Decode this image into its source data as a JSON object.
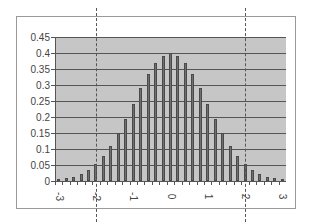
{
  "chart_data": {
    "type": "bar",
    "title": "",
    "xlabel": "",
    "ylabel": "",
    "categories": [
      "-3",
      "-2.8",
      "-2.6",
      "-2.4",
      "-2.2",
      "-2",
      "-1.8",
      "-1.6",
      "-1.4",
      "-1.2",
      "-1",
      "-0.8",
      "-0.6",
      "-0.4",
      "-0.2",
      "0",
      "0.2",
      "0.4",
      "0.6",
      "0.8",
      "1",
      "1.2",
      "1.4",
      "1.6",
      "1.8",
      "2",
      "2.2",
      "2.4",
      "2.6",
      "2.8",
      "3"
    ],
    "values": [
      0.0044,
      0.0079,
      0.0136,
      0.0224,
      0.0355,
      0.054,
      0.079,
      0.1109,
      0.1497,
      0.1942,
      0.242,
      0.2897,
      0.3332,
      0.3683,
      0.391,
      0.3989,
      0.391,
      0.3683,
      0.3332,
      0.2897,
      0.242,
      0.1942,
      0.1497,
      0.1109,
      0.079,
      0.054,
      0.0355,
      0.0224,
      0.0136,
      0.0079,
      0.0044
    ],
    "ylim": [
      0,
      0.45
    ],
    "yticks": [
      "0",
      "0.05",
      "0.1",
      "0.15",
      "0.2",
      "0.25",
      "0.3",
      "0.35",
      "0.4",
      "0.45"
    ],
    "xtick_labels": [
      "-3",
      "-2",
      "-1",
      "0",
      "1",
      "2",
      "3"
    ],
    "grid": true,
    "legend": null,
    "annotations": [
      {
        "type": "vertical-dashed-line",
        "x": -2
      },
      {
        "type": "vertical-dashed-line",
        "x": 2
      }
    ],
    "colors": {
      "plot_bg": "#c6c6c6",
      "bar": "#707070",
      "grid": "#555555"
    }
  }
}
